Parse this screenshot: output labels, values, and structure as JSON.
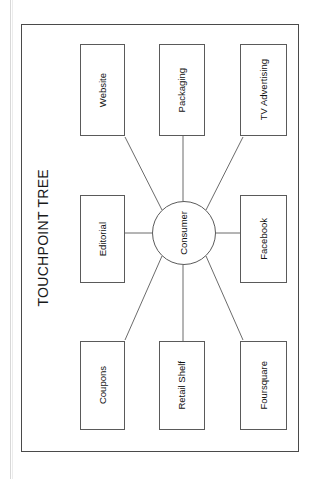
{
  "document": {
    "title": "TOUCHPOINT TREE"
  },
  "diagram": {
    "type": "hub-and-spoke",
    "center": {
      "id": "consumer",
      "label": "Consumer",
      "shape": "circle"
    },
    "nodes": [
      {
        "id": "website",
        "label": "Website",
        "row": "top",
        "col": "a"
      },
      {
        "id": "packaging",
        "label": "Packaging",
        "row": "top",
        "col": "b"
      },
      {
        "id": "tv-advertising",
        "label": "TV Advertising",
        "row": "top",
        "col": "c"
      },
      {
        "id": "editorial",
        "label": "Editorial",
        "row": "middle",
        "col": "a"
      },
      {
        "id": "facebook",
        "label": "Facebook",
        "row": "middle",
        "col": "c"
      },
      {
        "id": "coupons",
        "label": "Coupons",
        "row": "bottom",
        "col": "a"
      },
      {
        "id": "retail-shelf",
        "label": "Retail Shelf",
        "row": "bottom",
        "col": "b"
      },
      {
        "id": "foursquare",
        "label": "Foursquare",
        "row": "bottom",
        "col": "c"
      }
    ],
    "edges": [
      {
        "from": "consumer",
        "to": "website"
      },
      {
        "from": "consumer",
        "to": "packaging"
      },
      {
        "from": "consumer",
        "to": "tv-advertising"
      },
      {
        "from": "consumer",
        "to": "editorial"
      },
      {
        "from": "consumer",
        "to": "facebook"
      },
      {
        "from": "consumer",
        "to": "coupons"
      },
      {
        "from": "consumer",
        "to": "retail-shelf"
      },
      {
        "from": "consumer",
        "to": "foursquare"
      }
    ],
    "orientation": "rotated-90-ccw",
    "colors": {
      "stroke": "#5a5a5a",
      "frame": "#4a4a4a",
      "text": "#111111",
      "background": "#ffffff"
    }
  }
}
